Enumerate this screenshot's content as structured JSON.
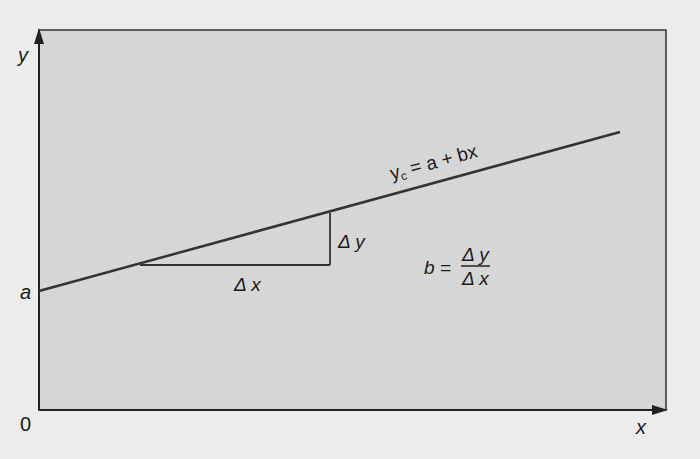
{
  "diagram": {
    "axes": {
      "x_label": "x",
      "y_label": "y",
      "origin_label": "0",
      "intercept_label": "a"
    },
    "line_equation": {
      "lhs": "y",
      "subscript": "c",
      "rhs": " = a + bx"
    },
    "triangle": {
      "dx_label": "Δ x",
      "dy_label": "Δ y"
    },
    "slope_formula": {
      "lhs": "b =",
      "numerator": "Δ y",
      "denominator": "Δ x"
    },
    "colors": {
      "panel_fill": "#d6d6d6",
      "background": "#ececec",
      "line": "#333333"
    }
  }
}
